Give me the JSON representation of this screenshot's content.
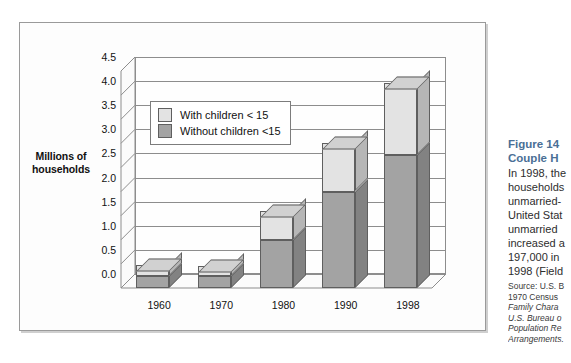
{
  "axis_title": "Millions of\nhouseholds",
  "legend": {
    "items": [
      {
        "label": "With children < 15",
        "color": "#e3e3e3",
        "key": "with_children"
      },
      {
        "label": "Without children <15",
        "color": "#a3a3a3",
        "key": "without_children"
      }
    ]
  },
  "caption": {
    "title_line1": "Figure 14",
    "title_line2": "Couple H",
    "body_lines": [
      "In 1998, the",
      "households",
      "unmarried-",
      "United Stat",
      "unmarried",
      "increased a",
      "197,000 in",
      "1998 (Field"
    ],
    "source_lines": [
      "Source: U.S. B",
      "1970 Census",
      "Family Chara",
      "U.S. Bureau o",
      "Population Re",
      "Arrangements."
    ]
  },
  "chart_data": {
    "type": "bar",
    "subtype": "stacked-3d-column",
    "title": "",
    "xlabel": "",
    "ylabel": "Millions of households",
    "categories": [
      "1960",
      "1970",
      "1980",
      "1990",
      "1998"
    ],
    "series": [
      {
        "name": "Without children <15",
        "color": "#a3a3a3",
        "values": [
          0.25,
          0.25,
          1.0,
          2.0,
          2.75
        ]
      },
      {
        "name": "With children < 15",
        "color": "#e3e3e3",
        "values": [
          0.22,
          0.2,
          0.6,
          1.0,
          1.5
        ]
      }
    ],
    "totals": [
      0.47,
      0.45,
      1.6,
      3.0,
      4.25
    ],
    "ylim": [
      0.0,
      4.5
    ],
    "ytick_step": 0.5,
    "yticks": [
      "4.5",
      "4.0",
      "3.5",
      "3.0",
      "2.5",
      "2.0",
      "1.5",
      "1.0",
      "0.5",
      "0.0"
    ],
    "grid": true,
    "legend_position": "inside-upper-left"
  }
}
